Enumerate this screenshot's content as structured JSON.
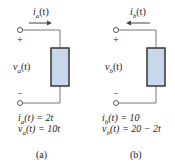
{
  "diagram": {
    "type": "circuit-element-pair",
    "colors": {
      "wire": "#777777",
      "box_fill": "#c9d7ea",
      "box_border": "#333333",
      "arrow": "#444444"
    },
    "circuits": [
      {
        "id": "a",
        "current_label": "i",
        "current_sub": "a",
        "current_arg": "(t)",
        "current_direction": "right",
        "voltage_label": "v",
        "voltage_sub": "a",
        "voltage_arg": "(t)",
        "plus": "+",
        "minus": "−",
        "eq1": "i_a(t) = 2t",
        "eq1_lhs": "i",
        "eq1_sub": "a",
        "eq1_rhs": "(t) = 2t",
        "eq2_lhs": "v",
        "eq2_sub": "a",
        "eq2_rhs": "(t) = 10t",
        "caption": "(a)"
      },
      {
        "id": "b",
        "current_label": "i",
        "current_sub": "b",
        "current_arg": "(t)",
        "current_direction": "left",
        "voltage_label": "v",
        "voltage_sub": "b",
        "voltage_arg": "(t)",
        "plus": "+",
        "minus": "−",
        "eq1_lhs": "i",
        "eq1_sub": "b",
        "eq1_rhs": "(t) = 10",
        "eq2_lhs": "v",
        "eq2_sub": "b",
        "eq2_rhs": "(t) = 20 − 2t",
        "caption": "(b)"
      }
    ]
  }
}
